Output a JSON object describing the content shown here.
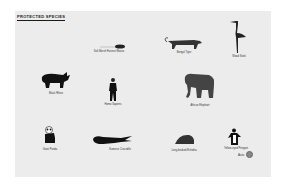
{
  "page": {
    "title": "PROTECTED SPECIES",
    "background": "#ffffff",
    "card_color": "#ececec"
  },
  "species": [
    {
      "name": "Salt Marsh Harvest Mouse",
      "icon": "mouse-icon"
    },
    {
      "name": "Bengal Tiger",
      "icon": "tiger-icon"
    },
    {
      "name": "Wood Stork",
      "icon": "stork-icon"
    },
    {
      "name": "Black Rhino",
      "icon": "rhino-icon"
    },
    {
      "name": "Homo Sapiens",
      "icon": "person-icon"
    },
    {
      "name": "African Elephant",
      "icon": "elephant-icon"
    },
    {
      "name": "Giant Panda",
      "icon": "panda-icon"
    },
    {
      "name": "Siamese Crocodile",
      "icon": "crocodile-icon"
    },
    {
      "name": "Long-beaked Echidna",
      "icon": "echidna-icon"
    },
    {
      "name": "Yellow-eyed Penguin",
      "icon": "penguin-icon"
    }
  ],
  "footer": {
    "auto_label": "Auto",
    "auto_icon": "settings-circle-icon"
  }
}
